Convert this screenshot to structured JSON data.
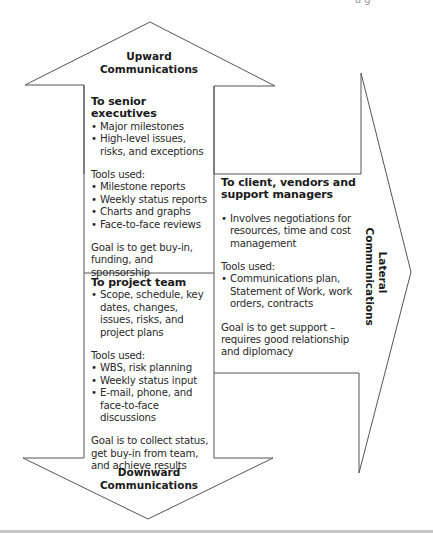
{
  "diagram": {
    "type": "communication-directions",
    "colors": {
      "stroke": "#555555",
      "text": "#222222",
      "bottom_bar": "#c8c8c8"
    },
    "cropped_fragment": "a    g",
    "upward": {
      "label_line1": "Upward",
      "label_line2": "Communications",
      "heading": "To senior executives",
      "items": [
        "Major milestones",
        "High-level issues, risks, and exceptions"
      ],
      "tools_label": "Tools used:",
      "tools": [
        "Milestone reports",
        "Weekly status reports",
        "Charts and graphs",
        "Face-to-face reviews"
      ],
      "goal": "Goal is to get buy-in, funding, and sponsorship"
    },
    "downward": {
      "label_line1": "Downward",
      "label_line2": "Communications",
      "heading": "To project team",
      "items": [
        "Scope, schedule, key dates, changes, issues, risks, and project plans"
      ],
      "tools_label": "Tools used:",
      "tools": [
        "WBS, risk planning",
        "Weekly status input",
        "E-mail, phone, and face-to-face discussions"
      ],
      "goal": "Goal is to collect status, get buy-in from team, and achieve results"
    },
    "lateral": {
      "label_line1": "Lateral",
      "label_line2": "Communications",
      "heading": "To client, vendors and support managers",
      "items": [
        "Involves negotiations for resources, time and cost management"
      ],
      "tools_label": "Tools used:",
      "tools": [
        "Communications plan, Statement of Work, work orders, contracts"
      ],
      "goal": "Goal is to get support – requires good relationship and diplomacy"
    }
  }
}
